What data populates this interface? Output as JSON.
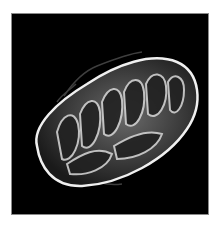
{
  "image": {
    "subject": "mitochondrion",
    "description": "Grayscale scanning-electron-microscope style image of a mitochondrion showing cristae on a black background",
    "colors": {
      "background": "#000000",
      "frame_border": "#8a8a8a",
      "page": "#ffffff",
      "membrane": "#e8e8e8"
    }
  }
}
